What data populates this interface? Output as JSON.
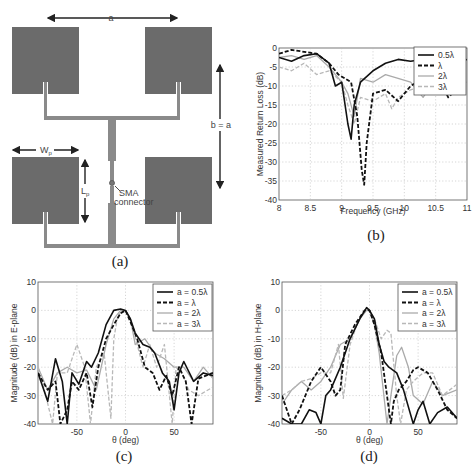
{
  "figure": {
    "panels": [
      {
        "id": "a",
        "caption": "(a)"
      },
      {
        "id": "b",
        "caption": "(b)"
      },
      {
        "id": "c",
        "caption": "(c)"
      },
      {
        "id": "d",
        "caption": "(d)"
      }
    ]
  },
  "diagram": {
    "label_a": "a",
    "label_b": "b = a",
    "label_wp": "W",
    "label_wp_sub": "p",
    "label_lp": "L",
    "label_lp_sub": "p",
    "label_sma1": "SMA",
    "label_sma2": "connector",
    "patch_color": "#6b6b6b",
    "feed_color": "#8a8a8a"
  },
  "chart_data": [
    {
      "panel": "b",
      "type": "line",
      "title": "",
      "xlabel": "Frequency (GHz)",
      "ylabel": "Measured Return Loss (dB)",
      "xlim": [
        8,
        11
      ],
      "ylim": [
        -40,
        0
      ],
      "xticks": [
        "8",
        "8.5",
        "9",
        "9.5",
        "10",
        "10.5",
        "11"
      ],
      "yticks": [
        "0",
        "-5",
        "-10",
        "-15",
        "-20",
        "-25",
        "-30",
        "-35",
        "-40"
      ],
      "grid": true,
      "legend_position": "upper right",
      "series": [
        {
          "name": "0.5λ",
          "style": "solid-black",
          "x": [
            8.0,
            8.2,
            8.4,
            8.6,
            8.8,
            8.9,
            9.0,
            9.1,
            9.15,
            9.2,
            9.3,
            9.5,
            9.7,
            9.9,
            10.1,
            10.3,
            10.5,
            10.7,
            11.0
          ],
          "y": [
            -2.5,
            -3.5,
            -2.0,
            -1.5,
            -4,
            -10,
            -9,
            -20,
            -24,
            -15,
            -9,
            -6,
            -4,
            -3,
            -3.5,
            -3,
            -4,
            -5,
            -3
          ]
        },
        {
          "name": "λ",
          "style": "dashed-black",
          "x": [
            8.0,
            8.2,
            8.4,
            8.6,
            8.8,
            8.95,
            9.05,
            9.15,
            9.25,
            9.32,
            9.36,
            9.4,
            9.5,
            9.7,
            9.9,
            10.1,
            10.3,
            10.5,
            10.7,
            11.0
          ],
          "y": [
            -1.5,
            -0.5,
            -1.0,
            -1.5,
            -4,
            -7,
            -8,
            -9,
            -18,
            -32,
            -36,
            -25,
            -12,
            -11,
            -14,
            -10,
            -8,
            -6,
            -13,
            -8
          ]
        },
        {
          "name": "2λ",
          "style": "solid-gray",
          "x": [
            8.0,
            8.2,
            8.4,
            8.6,
            8.8,
            9.0,
            9.1,
            9.2,
            9.3,
            9.5,
            9.7,
            9.9,
            10.1,
            10.3,
            10.5,
            10.7,
            11.0
          ],
          "y": [
            -2.5,
            -2.0,
            -3,
            -2,
            -5,
            -9,
            -12,
            -18,
            -8,
            -9,
            -7,
            -8,
            -9,
            -13,
            -8,
            -10,
            -9
          ]
        },
        {
          "name": "3λ",
          "style": "dashed-gray",
          "x": [
            8.0,
            8.2,
            8.4,
            8.6,
            8.8,
            9.0,
            9.1,
            9.2,
            9.3,
            9.5,
            9.7,
            9.8,
            9.9,
            10.1,
            10.3,
            10.5,
            11.0
          ],
          "y": [
            -5,
            -6,
            -4,
            -7,
            -6,
            -9,
            -15,
            -20,
            -13,
            -14,
            -12,
            -16,
            -13,
            -11,
            -10,
            -12,
            -10
          ]
        }
      ]
    },
    {
      "panel": "c",
      "type": "line",
      "title": "",
      "xlabel": "θ (deg)",
      "ylabel": "Magnitude (dB) in E-plane",
      "xlim": [
        -90,
        90
      ],
      "ylim": [
        -40,
        10
      ],
      "xticks": [
        "-50",
        "0",
        "50"
      ],
      "yticks": [
        "10",
        "0",
        "-10",
        "-20",
        "-30",
        "-40"
      ],
      "grid": true,
      "legend_position": "upper right",
      "series": [
        {
          "name": "a = 0.5λ",
          "style": "solid-black",
          "x": [
            -90,
            -80,
            -72,
            -65,
            -60,
            -55,
            -48,
            -40,
            -35,
            -28,
            -20,
            -12,
            -5,
            0,
            5,
            10,
            18,
            25,
            30,
            38,
            45,
            50,
            55,
            60,
            70,
            80,
            90
          ],
          "y": [
            -22,
            -32,
            -17,
            -25,
            -40,
            -22,
            -26,
            -18,
            -20,
            -15,
            -5,
            0,
            0.5,
            0,
            -3,
            -8,
            -12,
            -13,
            -15,
            -22,
            -25,
            -35,
            -22,
            -18,
            -25,
            -22,
            -23
          ]
        },
        {
          "name": "a = λ",
          "style": "dashed-black",
          "x": [
            -90,
            -80,
            -72,
            -67,
            -60,
            -55,
            -48,
            -40,
            -34,
            -28,
            -20,
            -12,
            -5,
            0,
            5,
            12,
            20,
            28,
            35,
            42,
            48,
            55,
            62,
            68,
            75,
            90
          ],
          "y": [
            -22,
            -28,
            -25,
            -40,
            -35,
            -25,
            -28,
            -22,
            -34,
            -20,
            -10,
            -5,
            -1,
            0,
            -4,
            -10,
            -20,
            -22,
            -28,
            -23,
            -30,
            -20,
            -25,
            -40,
            -24,
            -22
          ]
        },
        {
          "name": "a = 2λ",
          "style": "solid-gray",
          "x": [
            -90,
            -80,
            -70,
            -60,
            -50,
            -40,
            -30,
            -20,
            -12,
            -5,
            0,
            5,
            10,
            20,
            30,
            40,
            50,
            60,
            70,
            80,
            90
          ],
          "y": [
            -20,
            -28,
            -22,
            -20,
            -22,
            -21,
            -28,
            -12,
            -3,
            0,
            0,
            -3,
            -12,
            -10,
            -15,
            -17,
            -20,
            -20,
            -25,
            -20,
            -24
          ]
        },
        {
          "name": "a = 3λ",
          "style": "dashed-gray",
          "x": [
            -90,
            -82,
            -75,
            -70,
            -60,
            -50,
            -42,
            -36,
            -30,
            -22,
            -15,
            -12,
            -8,
            -3,
            0,
            5,
            12,
            18,
            25,
            32,
            40,
            48,
            52,
            58,
            65,
            75,
            90
          ],
          "y": [
            -20,
            -30,
            -40,
            -22,
            -22,
            -12,
            -20,
            -40,
            -20,
            -15,
            -38,
            -10,
            -2,
            0,
            0,
            -3,
            -12,
            -20,
            -12,
            -20,
            -12,
            -40,
            -20,
            -22,
            -28,
            -30,
            -27
          ]
        }
      ]
    },
    {
      "panel": "d",
      "type": "line",
      "title": "",
      "xlabel": "θ (deg)",
      "ylabel": "Magnitude (dB) in H-plane",
      "xlim": [
        -90,
        90
      ],
      "ylim": [
        -40,
        10
      ],
      "xticks": [
        "-50",
        "0",
        "50"
      ],
      "yticks": [
        "10",
        "0",
        "-10",
        "-20",
        "-30",
        "-40"
      ],
      "grid": true,
      "legend_position": "upper right",
      "series": [
        {
          "name": "a = 0.5λ",
          "style": "solid-black",
          "x": [
            -90,
            -80,
            -70,
            -62,
            -55,
            -50,
            -45,
            -40,
            -30,
            -20,
            -10,
            -3,
            0,
            5,
            10,
            15,
            20,
            28,
            35,
            45,
            50,
            55,
            62,
            70,
            80,
            90
          ],
          "y": [
            -38,
            -40,
            -40,
            -35,
            -36,
            -40,
            -30,
            -28,
            -20,
            -10,
            -3,
            1,
            0,
            -3,
            -12,
            -18,
            -20,
            -22,
            -28,
            -40,
            -35,
            -32,
            -40,
            -36,
            -34,
            -38
          ]
        },
        {
          "name": "a = λ",
          "style": "dashed-black",
          "x": [
            -90,
            -80,
            -72,
            -60,
            -50,
            -40,
            -35,
            -30,
            -25,
            -15,
            -5,
            0,
            5,
            12,
            18,
            22,
            25,
            30,
            38,
            45,
            50,
            60,
            70,
            80,
            90
          ],
          "y": [
            -30,
            -40,
            -35,
            -25,
            -20,
            -25,
            -30,
            -28,
            -12,
            -5,
            0,
            0,
            -5,
            -15,
            -30,
            -40,
            -32,
            -28,
            -25,
            -21,
            -20,
            -22,
            -28,
            -35,
            -38
          ]
        },
        {
          "name": "a = 2λ",
          "style": "solid-gray",
          "x": [
            -90,
            -80,
            -70,
            -60,
            -50,
            -40,
            -30,
            -20,
            -10,
            -3,
            0,
            5,
            10,
            18,
            22,
            28,
            33,
            40,
            45,
            55,
            65,
            75,
            90
          ],
          "y": [
            -33,
            -28,
            -25,
            -28,
            -25,
            -20,
            -12,
            -10,
            -3,
            0,
            0,
            -5,
            -15,
            -40,
            -30,
            -16,
            -13,
            -20,
            -30,
            -33,
            -25,
            -30,
            -28
          ]
        },
        {
          "name": "a = 3λ",
          "style": "dashed-gray",
          "x": [
            -90,
            -80,
            -70,
            -60,
            -50,
            -40,
            -32,
            -27,
            -20,
            -12,
            -5,
            0,
            5,
            12,
            18,
            22,
            28,
            32,
            38,
            45,
            55,
            65,
            75,
            90
          ],
          "y": [
            -30,
            -28,
            -25,
            -24,
            -22,
            -22,
            -12,
            -31,
            -12,
            -4,
            0,
            0,
            -3,
            -10,
            -7,
            -8,
            -30,
            -40,
            -28,
            -25,
            -22,
            -22,
            -30,
            -26
          ]
        }
      ]
    }
  ]
}
